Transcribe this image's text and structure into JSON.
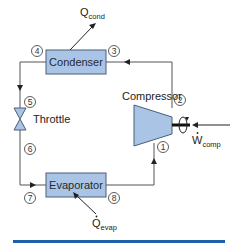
{
  "diagram": {
    "type": "refrigeration-cycle",
    "components": {
      "condenser": {
        "label": "Condenser"
      },
      "evaporator": {
        "label": "Evaporator"
      },
      "compressor": {
        "label": "Compressor"
      },
      "throttle": {
        "label": "Throttle"
      }
    },
    "heat_flows": {
      "q_cond": {
        "main": "Q",
        "sub": "cond"
      },
      "q_evap": {
        "main": "Q",
        "sub": "evap"
      }
    },
    "work": {
      "main": "W",
      "sub": "comp"
    },
    "state_points": [
      "1",
      "2",
      "3",
      "4",
      "5",
      "6",
      "7",
      "8"
    ],
    "colors": {
      "component_fill": "#a9c4e4",
      "component_stroke": "#4a5e7a",
      "line": "#555555",
      "footer_bar": "#1f5ea8"
    }
  }
}
